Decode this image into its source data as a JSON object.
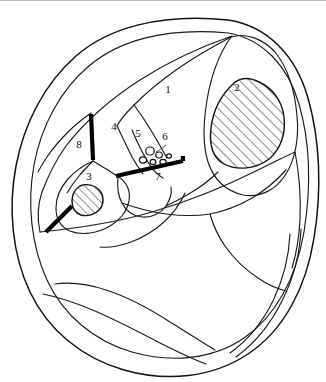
{
  "figure": {
    "background_color": "#ffffff",
    "line_color": "#111111",
    "septum_color": "#000000",
    "hatch_color": "#111111",
    "width": 326,
    "height": 382
  },
  "labels": [
    {
      "id": "1",
      "text": "1",
      "x": 168,
      "y": 93
    },
    {
      "id": "2",
      "text": "2",
      "x": 237,
      "y": 91
    },
    {
      "id": "3",
      "text": "3",
      "x": 89,
      "y": 180
    },
    {
      "id": "4",
      "text": "4",
      "x": 114,
      "y": 130
    },
    {
      "id": "5",
      "text": "5",
      "x": 138,
      "y": 137
    },
    {
      "id": "6",
      "text": "6",
      "x": 165,
      "y": 140
    },
    {
      "id": "7",
      "text": "7",
      "x": 158,
      "y": 180
    },
    {
      "id": "8",
      "text": "8",
      "x": 79,
      "y": 148
    }
  ],
  "hatched_regions": [
    {
      "name": "region-2-hatched",
      "label": "2"
    },
    {
      "name": "region-3-hatched",
      "label": "3"
    }
  ],
  "vessel_cluster": {
    "name": "region-6-vessels",
    "count": 6,
    "label": "6"
  },
  "septa": [
    {
      "name": "septum-upper-left",
      "label": "8"
    },
    {
      "name": "septum-horizontal",
      "label": "7"
    },
    {
      "name": "septum-lower-left",
      "label": "3"
    }
  ]
}
